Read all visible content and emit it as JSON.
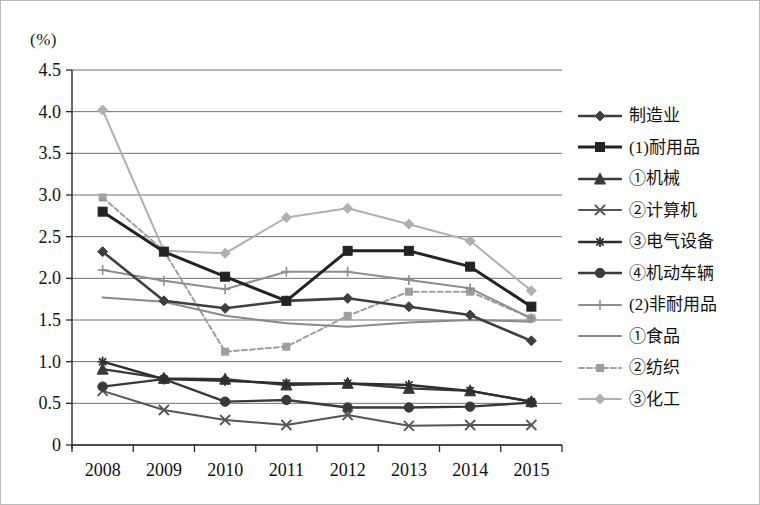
{
  "unit_label": "(%)",
  "legend": {
    "position": "right",
    "items": [
      {
        "label": "制造业",
        "marker": "diamond",
        "color": "#3f3f3f",
        "width": 2.6,
        "dash": ""
      },
      {
        "label": "(1)耐用品",
        "marker": "square",
        "color": "#232323",
        "width": 3.0,
        "dash": ""
      },
      {
        "label": "①机械",
        "marker": "triangle",
        "color": "#3a3a3a",
        "width": 2.4,
        "dash": ""
      },
      {
        "label": "②计算机",
        "marker": "cross",
        "color": "#555555",
        "width": 2.0,
        "dash": ""
      },
      {
        "label": "③电气设备",
        "marker": "asterisk",
        "color": "#2e2e2e",
        "width": 2.4,
        "dash": ""
      },
      {
        "label": "④机动车辆",
        "marker": "circle",
        "color": "#3a3a3a",
        "width": 2.4,
        "dash": ""
      },
      {
        "label": "(2)非耐用品",
        "marker": "plus",
        "color": "#8e8e8e",
        "width": 2.0,
        "dash": ""
      },
      {
        "label": "①食品",
        "marker": "none",
        "color": "#8a8a8a",
        "width": 2.0,
        "dash": ""
      },
      {
        "label": "②纺织",
        "marker": "dashsq",
        "color": "#9e9e9e",
        "width": 2.0,
        "dash": "5,3"
      },
      {
        "label": "③化工",
        "marker": "diamond-light",
        "color": "#b0b0b0",
        "width": 2.0,
        "dash": ""
      }
    ]
  },
  "chart_data": {
    "type": "line",
    "title": "",
    "xlabel": "",
    "ylabel": "(%)",
    "ylim": [
      0,
      4.5
    ],
    "yticks": [
      "0",
      "0.5",
      "1.0",
      "1.5",
      "2.0",
      "2.5",
      "3.0",
      "3.5",
      "4.0",
      "4.5"
    ],
    "ytick_values": [
      0,
      0.5,
      1.0,
      1.5,
      2.0,
      2.5,
      3.0,
      3.5,
      4.0,
      4.5
    ],
    "grid": true,
    "legend_position": "right",
    "categories": [
      "2008",
      "2009",
      "2010",
      "2011",
      "2012",
      "2013",
      "2014",
      "2015"
    ],
    "series": [
      {
        "name": "制造业",
        "values": [
          2.32,
          1.73,
          1.64,
          1.73,
          1.76,
          1.66,
          1.56,
          1.25
        ]
      },
      {
        "name": "(1)耐用品",
        "values": [
          2.8,
          2.32,
          2.02,
          1.73,
          2.33,
          2.33,
          2.14,
          1.66
        ]
      },
      {
        "name": "①机械",
        "values": [
          0.91,
          0.8,
          0.79,
          0.72,
          0.74,
          0.68,
          0.65,
          0.52
        ]
      },
      {
        "name": "②计算机",
        "values": [
          0.65,
          0.42,
          0.3,
          0.24,
          0.36,
          0.23,
          0.24,
          0.24
        ]
      },
      {
        "name": "③电气设备",
        "values": [
          1.0,
          0.79,
          0.77,
          0.74,
          0.74,
          0.72,
          0.65,
          0.52
        ]
      },
      {
        "name": "④机动车辆",
        "values": [
          0.7,
          0.79,
          0.52,
          0.54,
          0.45,
          0.45,
          0.46,
          0.51
        ]
      },
      {
        "name": "(2)非耐用品",
        "values": [
          2.1,
          1.97,
          1.87,
          2.08,
          2.08,
          1.98,
          1.88,
          1.52
        ]
      },
      {
        "name": "①食品",
        "values": [
          1.77,
          1.72,
          1.55,
          1.46,
          1.42,
          1.47,
          1.5,
          1.48
        ]
      },
      {
        "name": "②纺织",
        "values": [
          2.97,
          2.33,
          1.12,
          1.18,
          1.55,
          1.84,
          1.84,
          1.52
        ]
      },
      {
        "name": "③化工",
        "values": [
          4.02,
          2.33,
          2.3,
          2.73,
          2.84,
          2.65,
          2.45,
          1.85
        ]
      }
    ]
  }
}
